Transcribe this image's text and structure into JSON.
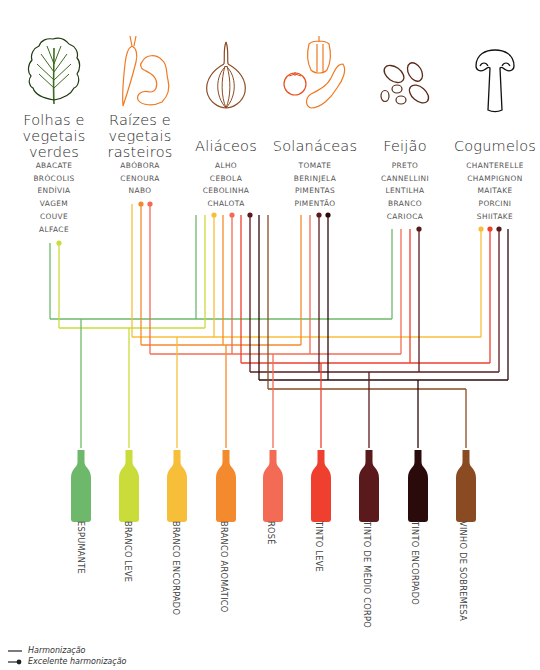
{
  "categories": [
    {
      "id": "folhas",
      "title_lines": [
        "Folhas e",
        "vegetais",
        "verdes"
      ],
      "icon": "leaf-icon",
      "items": [
        "ABACATE",
        "BRÓCOLIS",
        "ENDÍVIA",
        "VAGEM",
        "COUVE",
        "ALFACE"
      ]
    },
    {
      "id": "raizes",
      "title_lines": [
        "Raízes e",
        "vegetais",
        "rasteiros"
      ],
      "icon": "carrot-squash-icon",
      "items": [
        "ABÓBORA",
        "CENOURA",
        "NABO"
      ]
    },
    {
      "id": "aliaceos",
      "title_lines": [
        "Aliáceos"
      ],
      "icon": "onion-icon",
      "items": [
        "ALHO",
        "CEBOLA",
        "CEBOLINHA",
        "CHALOTA"
      ]
    },
    {
      "id": "solanaceas",
      "title_lines": [
        "Solanáceas"
      ],
      "icon": "pepper-tomato-eggplant-icon",
      "items": [
        "TOMATE",
        "BERINJELA",
        "PIMENTAS",
        "PIMENTÃO"
      ]
    },
    {
      "id": "feijao",
      "title_lines": [
        "Feijão"
      ],
      "icon": "beans-icon",
      "items": [
        "PRETO",
        "CANNELLINI",
        "LENTILHA",
        "BRANCO",
        "CARIOCA"
      ]
    },
    {
      "id": "cogumelos",
      "title_lines": [
        "Cogumelos"
      ],
      "icon": "mushroom-icon",
      "items": [
        "CHANTERELLE",
        "CHAMPIGNON",
        "MAITAKE",
        "PORCINI",
        "SHIITAKE"
      ]
    }
  ],
  "wines": [
    {
      "label": "ESPUMANTE",
      "color": "#6db86a"
    },
    {
      "label": "BRANCO LEVE",
      "color": "#c9dc3a"
    },
    {
      "label": "BRANCO ENCORPADO",
      "color": "#f7be3a"
    },
    {
      "label": "BRANCO AROMÁTICO",
      "color": "#f48a2e"
    },
    {
      "label": "ROSÉ",
      "color": "#f36b55"
    },
    {
      "label": "TINTO LEVE",
      "color": "#ee3f2f"
    },
    {
      "label": "TINTO DE MÉDIO CORPO",
      "color": "#5a1a1c"
    },
    {
      "label": "TINTO ENCORPADO",
      "color": "#2b0a0c"
    },
    {
      "label": "VINHO DE SOBREMESA",
      "color": "#8a4a22"
    }
  ],
  "pairings": {
    "folhas": [
      {
        "wine": 0,
        "excellent": false
      },
      {
        "wine": 1,
        "excellent": true
      }
    ],
    "raizes": [
      {
        "wine": 2,
        "excellent": false
      },
      {
        "wine": 3,
        "excellent": true
      },
      {
        "wine": 4,
        "excellent": true
      }
    ],
    "aliaceos": [
      {
        "wine": 0,
        "excellent": false
      },
      {
        "wine": 1,
        "excellent": false
      },
      {
        "wine": 2,
        "excellent": true
      },
      {
        "wine": 3,
        "excellent": false
      },
      {
        "wine": 4,
        "excellent": true
      },
      {
        "wine": 5,
        "excellent": false
      },
      {
        "wine": 6,
        "excellent": true
      },
      {
        "wine": 7,
        "excellent": false
      },
      {
        "wine": 8,
        "excellent": false
      }
    ],
    "solanaceas": [
      {
        "wine": 3,
        "excellent": false
      },
      {
        "wine": 4,
        "excellent": false
      },
      {
        "wine": 6,
        "excellent": true
      },
      {
        "wine": 7,
        "excellent": true
      }
    ],
    "feijao": [
      {
        "wine": 0,
        "excellent": false
      },
      {
        "wine": 4,
        "excellent": false
      },
      {
        "wine": 5,
        "excellent": false
      },
      {
        "wine": 6,
        "excellent": true
      }
    ],
    "cogumelos": [
      {
        "wine": 2,
        "excellent": true
      },
      {
        "wine": 5,
        "excellent": true
      },
      {
        "wine": 6,
        "excellent": true
      },
      {
        "wine": 7,
        "excellent": false
      }
    ]
  },
  "legend": {
    "pairing": "Harmonização",
    "excellent_pairing": "Excelente harmonização"
  }
}
